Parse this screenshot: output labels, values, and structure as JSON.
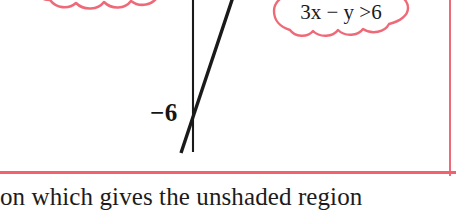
{
  "figure": {
    "axis_label": "−6",
    "border_color": "#f2616e",
    "line_color": "#1a1a1a",
    "graph": {
      "type": "line",
      "description": "Vertical y-axis with a steep straight line crossing it just above the -6 mark",
      "y_axis": {
        "x": 193,
        "y_top": 0,
        "y_bottom": 152
      },
      "boundary_line": {
        "x1": 232,
        "y1": 0,
        "x2": 182,
        "y2": 152
      },
      "intersection_label": "−6",
      "intersection_point": {
        "x": 193,
        "y": 115
      }
    }
  },
  "callouts": [
    {
      "id": "left",
      "text": "",
      "color": "#ef6a78",
      "note": "cloud bubble clipped at top of frame, only scalloped lower edge visible"
    },
    {
      "id": "right",
      "color": "#ef6a78",
      "expression": "3x − y >6",
      "parts": {
        "coefficient": "3",
        "x": "x",
        "operator": "−",
        "y": "y",
        "relation": ">",
        "value": "6"
      }
    }
  ],
  "body": {
    "paragraph": "on which gives the unshaded region"
  }
}
